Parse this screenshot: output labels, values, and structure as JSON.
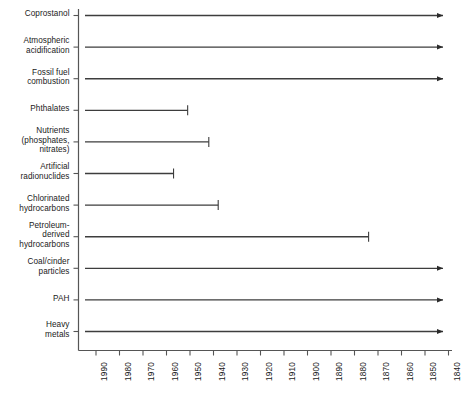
{
  "chart_data": {
    "type": "bar",
    "title": "",
    "subtitle": "",
    "xlabel": "",
    "ylabel": "",
    "orientation": "horizontal",
    "grid": false,
    "legend": "none",
    "x_axis": {
      "direction": "decreasing",
      "range_start": 1995,
      "range_end": 1835,
      "ticks": [
        1990,
        1980,
        1970,
        1960,
        1950,
        1940,
        1930,
        1920,
        1910,
        1900,
        1890,
        1880,
        1870,
        1860,
        1850,
        1840
      ],
      "tick_labels": [
        "1990",
        "1980",
        "1970",
        "1960",
        "1950",
        "1940",
        "1930",
        "1920",
        "1910",
        "1900",
        "1890",
        "1880",
        "1870",
        "1860",
        "1850",
        "1840"
      ],
      "tick_label_rotation": -90
    },
    "categories": [
      "Coprostanol",
      "Atmospheric\nacidification",
      "Fossil fuel\ncombustion",
      "Phthalates",
      "Nutrients\n(phosphates,\nnitrates)",
      "Artificial\nradionuclides",
      "Chlorinated\nhydrocarbons",
      "Petroleum-\nderived\nhydrocarbons",
      "Coal/cinder\nparticles",
      "PAH",
      "Heavy\nmetals"
    ],
    "bars": [
      {
        "label": "Coprostanol",
        "start_year": 1995,
        "end_year": 1835,
        "open_ended": true,
        "end_marker": "arrow"
      },
      {
        "label": "Atmospheric acidification",
        "start_year": 1995,
        "end_year": 1835,
        "open_ended": true,
        "end_marker": "arrow"
      },
      {
        "label": "Fossil fuel combustion",
        "start_year": 1995,
        "end_year": 1835,
        "open_ended": true,
        "end_marker": "arrow"
      },
      {
        "label": "Phthalates",
        "start_year": 1995,
        "end_year": 1951,
        "open_ended": false,
        "end_marker": "tick"
      },
      {
        "label": "Nutrients (phosphates, nitrates)",
        "start_year": 1995,
        "end_year": 1942,
        "open_ended": false,
        "end_marker": "tick"
      },
      {
        "label": "Artificial radionuclides",
        "start_year": 1995,
        "end_year": 1957,
        "open_ended": false,
        "end_marker": "tick"
      },
      {
        "label": "Chlorinated hydrocarbons",
        "start_year": 1995,
        "end_year": 1938,
        "open_ended": false,
        "end_marker": "tick"
      },
      {
        "label": "Petroleum-derived hydrocarbons",
        "start_year": 1995,
        "end_year": 1874,
        "open_ended": false,
        "end_marker": "tick"
      },
      {
        "label": "Coal/cinder particles",
        "start_year": 1995,
        "end_year": 1835,
        "open_ended": true,
        "end_marker": "arrow"
      },
      {
        "label": "PAH",
        "start_year": 1995,
        "end_year": 1835,
        "open_ended": true,
        "end_marker": "arrow"
      },
      {
        "label": "Heavy metals",
        "start_year": 1995,
        "end_year": 1835,
        "open_ended": true,
        "end_marker": "arrow"
      }
    ],
    "colors": {
      "line": "#3d3d3d",
      "axis": "#555555",
      "text": "#1a1a1a",
      "background": "#ffffff"
    }
  }
}
